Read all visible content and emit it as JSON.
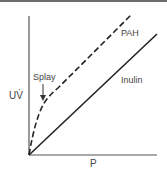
{
  "diagram": {
    "y_axis_label": "UV̇",
    "x_axis_label": "P",
    "annotation": "Splay",
    "series": [
      {
        "name": "PAH",
        "style": "dashed",
        "color": "#222222"
      },
      {
        "name": "Inulin",
        "style": "solid",
        "color": "#222222"
      }
    ]
  }
}
